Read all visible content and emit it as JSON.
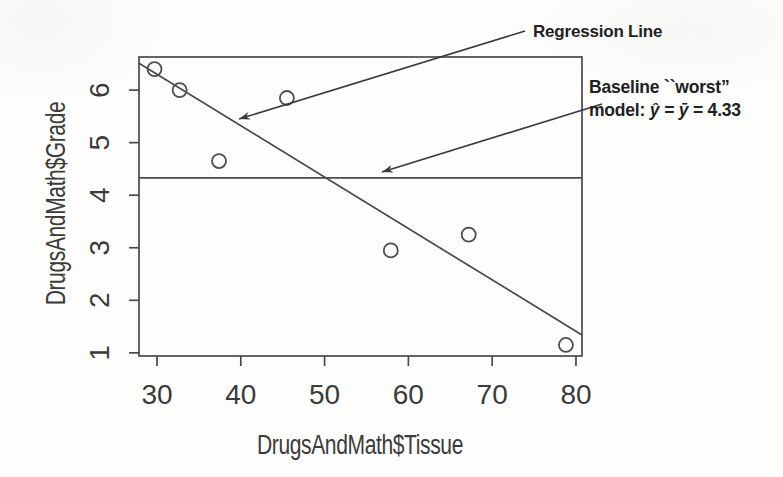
{
  "figure": {
    "background": "#fdfdfc",
    "ink_color": "#222222",
    "axis_text_color": "#3b3b3b",
    "line_color": "#4a4a4a"
  },
  "chart_data": {
    "type": "scatter",
    "title": "",
    "xlabel": "DrugsAndMath$Tissue",
    "ylabel": "DrugsAndMath$Grade",
    "x_ticks": [
      30,
      40,
      50,
      60,
      70,
      80
    ],
    "y_ticks": [
      1,
      2,
      3,
      4,
      5,
      6
    ],
    "xlim": [
      27.85,
      80.72
    ],
    "ylim": [
      0.94,
      6.63
    ],
    "grid": false,
    "legend": "none",
    "points": [
      {
        "x": 29.7,
        "y": 6.4
      },
      {
        "x": 32.7,
        "y": 6.0
      },
      {
        "x": 45.5,
        "y": 5.85
      },
      {
        "x": 37.4,
        "y": 4.65
      },
      {
        "x": 57.9,
        "y": 2.95
      },
      {
        "x": 67.2,
        "y": 3.25
      },
      {
        "x": 78.8,
        "y": 1.15
      }
    ],
    "regression_line": {
      "x1": 27.85,
      "y1": 6.51,
      "x2": 80.72,
      "y2": 1.34
    },
    "baseline_mean": {
      "y": 4.33
    }
  },
  "annotations": {
    "regression_label": "Regression Line",
    "baseline_line1": "Baseline ``worst”",
    "baseline_line2_prefix": "model: ",
    "baseline_line2_math": "ŷ = ȳ",
    "baseline_line2_suffix": " = 4.33"
  }
}
